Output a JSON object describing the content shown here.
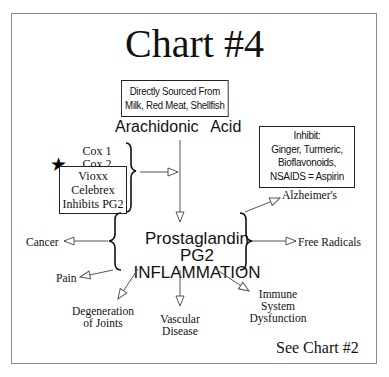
{
  "title": "Chart #4",
  "source_box": {
    "line1": "Directly Sourced From",
    "line2": "Milk, Red Meat, Shellfish"
  },
  "arachidonic_acid": "Arachidonic Acid",
  "inhibit_box": {
    "line1": "Inhibit:",
    "line2": "Ginger, Turmeric,",
    "line3": "Bioflavonoids,",
    "line4": "NSAIDS = Aspirin"
  },
  "cox": {
    "cox1": "Cox 1",
    "cox2": "Cox 2",
    "star_icon": "★",
    "drug_box": {
      "line1": "Vioxx",
      "line2": "Celebrex",
      "line3": "Inhibits PG2"
    }
  },
  "center": {
    "line1": "Prostaglandin",
    "line2": "PG2",
    "line3": "INFLAMMATION"
  },
  "outcomes": {
    "alzheimers": "Alzheimer's",
    "free_radicals": "Free Radicals",
    "cancer": "Cancer",
    "pain": "Pain",
    "degeneration_line1": "Degeneration",
    "degeneration_line2": "of Joints",
    "vascular_line1": "Vascular",
    "vascular_line2": "Disease",
    "immune_line1": "Immune",
    "immune_line2": "System",
    "immune_line3": "Dysfunction"
  },
  "footer": "See Chart #2",
  "colors": {
    "line": "#555555",
    "frame": "#8a8a8a",
    "text": "#111111"
  }
}
